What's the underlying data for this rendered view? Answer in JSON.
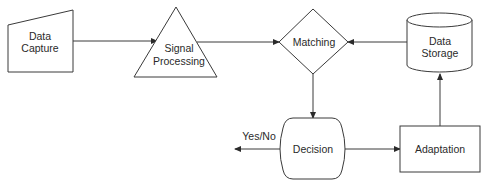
{
  "diagram": {
    "nodes": {
      "data_capture": {
        "line1": "Data",
        "line2": "Capture",
        "shape": "manual-input-trapezoid"
      },
      "signal_processing": {
        "line1": "Signal",
        "line2": "Processing",
        "shape": "triangle"
      },
      "matching": {
        "label": "Matching",
        "shape": "diamond"
      },
      "data_storage": {
        "line1": "Data",
        "line2": "Storage",
        "shape": "cylinder"
      },
      "decision": {
        "label": "Decision",
        "shape": "rounded-terminal"
      },
      "adaptation": {
        "label": "Adaptation",
        "shape": "rectangle"
      }
    },
    "edges": [
      {
        "from": "Data Capture",
        "to": "Signal Processing"
      },
      {
        "from": "Signal Processing",
        "to": "Matching"
      },
      {
        "from": "Data Storage",
        "to": "Matching"
      },
      {
        "from": "Matching",
        "to": "Decision"
      },
      {
        "from": "Decision",
        "to": "Adaptation"
      },
      {
        "from": "Adaptation",
        "to": "Data Storage"
      },
      {
        "from": "Decision",
        "to": "output",
        "label": "Yes/No"
      }
    ],
    "output_label": "Yes/No",
    "colors": {
      "stroke": "#3a3a3a",
      "text": "#2a2a2a",
      "background": "#ffffff"
    }
  }
}
